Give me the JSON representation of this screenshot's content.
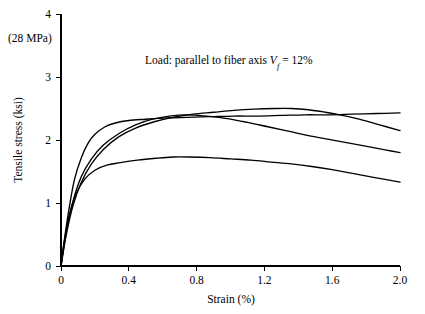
{
  "chart_data": {
    "type": "line",
    "title": "",
    "xlabel": "Strain (%)",
    "ylabel": "Tensile stress (ksi)",
    "xlim": [
      0,
      2.0
    ],
    "ylim": [
      0,
      4
    ],
    "xticks": [
      "0",
      "0.4",
      "0.8",
      "1.2",
      "1.6",
      "2.0"
    ],
    "xtick_values": [
      0,
      0.4,
      0.8,
      1.2,
      1.6,
      2.0
    ],
    "yticks": [
      "0",
      "1",
      "2",
      "3",
      "4"
    ],
    "ytick_values": [
      0,
      1,
      2,
      3,
      4
    ],
    "grid": false,
    "legend": "none",
    "corner_note": "(28 MPa)",
    "annotation": {
      "prefix": "Load: parallel to fiber axis ",
      "symbol": "V",
      "subscript": "f",
      "suffix": " = 12%",
      "full_text": "Load: parallel to fiber axis Vf = 12%"
    },
    "series": [
      {
        "name": "specimen-1",
        "points": [
          [
            0.0,
            0.0
          ],
          [
            0.02,
            0.42
          ],
          [
            0.05,
            0.95
          ],
          [
            0.08,
            1.38
          ],
          [
            0.12,
            1.72
          ],
          [
            0.16,
            1.95
          ],
          [
            0.2,
            2.09
          ],
          [
            0.26,
            2.21
          ],
          [
            0.32,
            2.27
          ],
          [
            0.4,
            2.31
          ],
          [
            0.5,
            2.33
          ],
          [
            0.62,
            2.35
          ],
          [
            0.74,
            2.36
          ],
          [
            0.88,
            2.37
          ],
          [
            1.02,
            2.38
          ],
          [
            1.16,
            2.38
          ],
          [
            1.3,
            2.39
          ],
          [
            1.44,
            2.4
          ],
          [
            1.58,
            2.4
          ],
          [
            1.72,
            2.41
          ],
          [
            1.86,
            2.42
          ],
          [
            2.0,
            2.43
          ]
        ]
      },
      {
        "name": "specimen-2",
        "points": [
          [
            0.0,
            0.0
          ],
          [
            0.03,
            0.48
          ],
          [
            0.07,
            0.95
          ],
          [
            0.12,
            1.33
          ],
          [
            0.18,
            1.62
          ],
          [
            0.25,
            1.85
          ],
          [
            0.34,
            2.05
          ],
          [
            0.44,
            2.19
          ],
          [
            0.55,
            2.29
          ],
          [
            0.66,
            2.36
          ],
          [
            0.78,
            2.41
          ],
          [
            0.9,
            2.44
          ],
          [
            1.02,
            2.47
          ],
          [
            1.14,
            2.49
          ],
          [
            1.26,
            2.5
          ],
          [
            1.36,
            2.5
          ],
          [
            1.46,
            2.48
          ],
          [
            1.56,
            2.44
          ],
          [
            1.66,
            2.39
          ],
          [
            1.76,
            2.33
          ],
          [
            1.88,
            2.24
          ],
          [
            2.0,
            2.15
          ]
        ]
      },
      {
        "name": "specimen-3",
        "points": [
          [
            0.0,
            0.0
          ],
          [
            0.03,
            0.52
          ],
          [
            0.07,
            1.02
          ],
          [
            0.12,
            1.42
          ],
          [
            0.18,
            1.7
          ],
          [
            0.25,
            1.92
          ],
          [
            0.34,
            2.1
          ],
          [
            0.44,
            2.24
          ],
          [
            0.54,
            2.33
          ],
          [
            0.64,
            2.38
          ],
          [
            0.74,
            2.4
          ],
          [
            0.86,
            2.38
          ],
          [
            0.98,
            2.34
          ],
          [
            1.1,
            2.28
          ],
          [
            1.22,
            2.21
          ],
          [
            1.34,
            2.14
          ],
          [
            1.46,
            2.07
          ],
          [
            1.58,
            2.01
          ],
          [
            1.7,
            1.95
          ],
          [
            1.82,
            1.89
          ],
          [
            1.92,
            1.84
          ],
          [
            2.0,
            1.8
          ]
        ]
      },
      {
        "name": "specimen-4",
        "points": [
          [
            0.0,
            0.0
          ],
          [
            0.02,
            0.4
          ],
          [
            0.05,
            0.82
          ],
          [
            0.09,
            1.15
          ],
          [
            0.14,
            1.38
          ],
          [
            0.2,
            1.52
          ],
          [
            0.27,
            1.6
          ],
          [
            0.35,
            1.64
          ],
          [
            0.45,
            1.68
          ],
          [
            0.56,
            1.71
          ],
          [
            0.66,
            1.73
          ],
          [
            0.76,
            1.73
          ],
          [
            0.88,
            1.72
          ],
          [
            1.0,
            1.7
          ],
          [
            1.12,
            1.68
          ],
          [
            1.24,
            1.65
          ],
          [
            1.36,
            1.62
          ],
          [
            1.48,
            1.58
          ],
          [
            1.6,
            1.53
          ],
          [
            1.72,
            1.47
          ],
          [
            1.86,
            1.4
          ],
          [
            2.0,
            1.33
          ]
        ]
      }
    ]
  }
}
